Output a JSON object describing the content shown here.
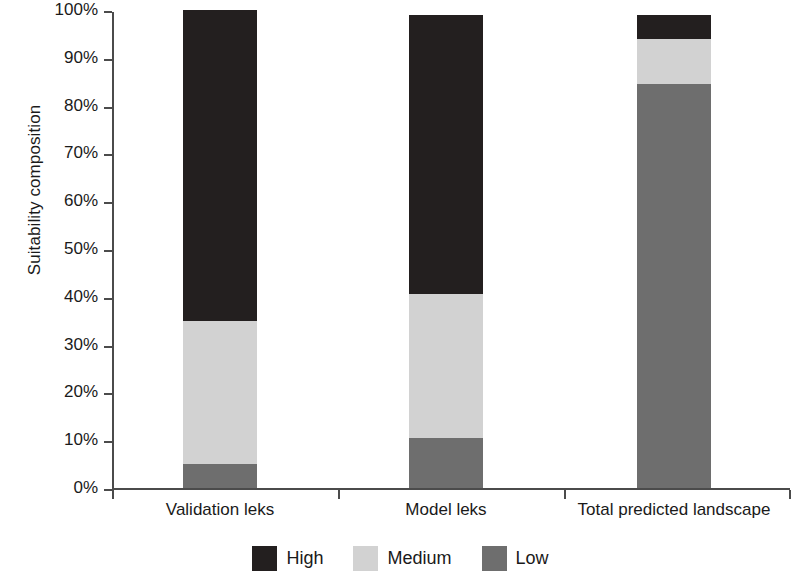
{
  "chart_data": {
    "type": "bar",
    "subtype": "stacked-bar-100-percent",
    "title": "",
    "xlabel": "",
    "ylabel": "Suitability composition",
    "categories": [
      "Validation leks",
      "Model leks",
      "Total predicted landscape"
    ],
    "series": [
      {
        "name": "High",
        "color": "#231f1f",
        "values": [
          65.0,
          58.5,
          5.0
        ]
      },
      {
        "name": "Medium",
        "color": "#d2d2d2",
        "values": [
          30.0,
          30.0,
          9.5
        ]
      },
      {
        "name": "Low",
        "color": "#6e6e6e",
        "values": [
          5.0,
          10.5,
          84.5
        ]
      }
    ],
    "ylim": [
      0,
      100
    ],
    "ytick_labels": [
      "100%",
      "90%",
      "80%",
      "70%",
      "60%",
      "50%",
      "40%",
      "30%",
      "20%",
      "10%",
      "0%"
    ],
    "ytick_values": [
      100,
      90,
      80,
      70,
      60,
      50,
      40,
      30,
      20,
      10,
      0
    ],
    "grid": false,
    "legend_position": "bottom-center",
    "stack_order_bottom_to_top": [
      "Low",
      "Medium",
      "High"
    ]
  },
  "axis": {
    "y_title": "Suitability composition"
  },
  "legend": {
    "items": [
      {
        "label": "High",
        "color": "#231f1f"
      },
      {
        "label": "Medium",
        "color": "#d2d2d2"
      },
      {
        "label": "Low",
        "color": "#6e6e6e"
      }
    ]
  }
}
